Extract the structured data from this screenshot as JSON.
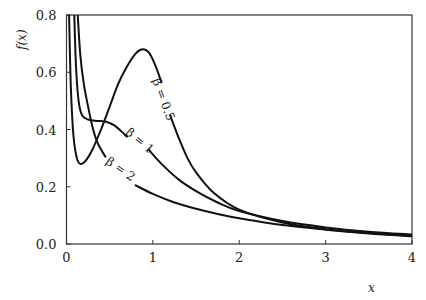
{
  "chart_data": {
    "type": "line",
    "title": "",
    "xlabel": "x",
    "ylabel": "f(x)",
    "xlim": [
      0,
      4
    ],
    "ylim": [
      0,
      0.8
    ],
    "grid": false,
    "legend": "inline labels on curves",
    "x_ticks": [
      "0",
      "1",
      "2",
      "3",
      "4"
    ],
    "y_ticks": [
      "0.0",
      "0.2",
      "0.4",
      "0.6",
      "0.8"
    ],
    "series": [
      {
        "name": "β = 0.5",
        "label_position": {
          "x": 1.08,
          "y": 0.5,
          "angle": 70
        },
        "segments": [
          [
            [
              0.03,
              0.8
            ],
            [
              0.05,
              0.55
            ],
            [
              0.08,
              0.38
            ],
            [
              0.12,
              0.3
            ],
            [
              0.16,
              0.28
            ],
            [
              0.22,
              0.29
            ],
            [
              0.3,
              0.33
            ],
            [
              0.4,
              0.4
            ],
            [
              0.5,
              0.48
            ],
            [
              0.6,
              0.56
            ],
            [
              0.7,
              0.62
            ],
            [
              0.8,
              0.665
            ],
            [
              0.88,
              0.68
            ],
            [
              0.95,
              0.67
            ],
            [
              1.02,
              0.63
            ],
            [
              1.1,
              0.565
            ]
          ],
          [
            [
              1.2,
              0.45
            ],
            [
              1.3,
              0.37
            ],
            [
              1.4,
              0.3
            ],
            [
              1.5,
              0.25
            ],
            [
              1.7,
              0.18
            ],
            [
              2.0,
              0.12
            ],
            [
              2.5,
              0.075
            ],
            [
              3.0,
              0.052
            ],
            [
              3.5,
              0.038
            ],
            [
              4.0,
              0.029
            ]
          ]
        ]
      },
      {
        "name": "β = 1",
        "label_position": {
          "x": 0.82,
          "y": 0.35,
          "angle": 40
        },
        "segments": [
          [
            [
              0.09,
              0.8
            ],
            [
              0.11,
              0.62
            ],
            [
              0.14,
              0.5
            ],
            [
              0.18,
              0.45
            ],
            [
              0.25,
              0.435
            ],
            [
              0.35,
              0.43
            ],
            [
              0.45,
              0.428
            ],
            [
              0.55,
              0.415
            ],
            [
              0.63,
              0.395
            ],
            [
              0.7,
              0.375
            ]
          ],
          [
            [
              0.95,
              0.33
            ],
            [
              1.1,
              0.28
            ],
            [
              1.3,
              0.225
            ],
            [
              1.5,
              0.185
            ],
            [
              1.75,
              0.145
            ],
            [
              2.0,
              0.115
            ],
            [
              2.5,
              0.08
            ],
            [
              3.0,
              0.058
            ],
            [
              3.5,
              0.043
            ],
            [
              4.0,
              0.033
            ]
          ]
        ]
      },
      {
        "name": "β = 2",
        "label_position": {
          "x": 0.6,
          "y": 0.25,
          "angle": 35
        },
        "segments": [
          [
            [
              0.13,
              0.8
            ],
            [
              0.16,
              0.66
            ],
            [
              0.2,
              0.56
            ],
            [
              0.25,
              0.48
            ],
            [
              0.3,
              0.41
            ],
            [
              0.35,
              0.36
            ],
            [
              0.4,
              0.33
            ],
            [
              0.45,
              0.305
            ]
          ],
          [
            [
              0.8,
              0.205
            ],
            [
              1.0,
              0.175
            ],
            [
              1.25,
              0.145
            ],
            [
              1.5,
              0.123
            ],
            [
              1.75,
              0.105
            ],
            [
              2.0,
              0.09
            ],
            [
              2.5,
              0.066
            ],
            [
              3.0,
              0.05
            ],
            [
              3.5,
              0.037
            ],
            [
              4.0,
              0.027
            ]
          ]
        ]
      }
    ]
  },
  "axes": {
    "x_title": "x",
    "y_title": "f(x)",
    "x_ticks": [
      "0",
      "1",
      "2",
      "3",
      "4"
    ],
    "y_ticks": [
      "0.0",
      "0.2",
      "0.4",
      "0.6",
      "0.8"
    ]
  },
  "labels": {
    "beta_half": "β = 0.5",
    "beta_one": "β = 1",
    "beta_two": "β = 2"
  },
  "colors": {
    "curve": "#111111",
    "axis": "#333333",
    "background": "#ffffff"
  }
}
